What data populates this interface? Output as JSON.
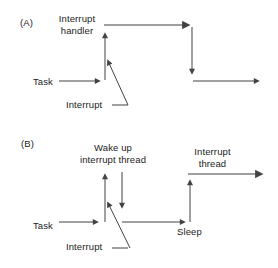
{
  "colors": {
    "line": "#434343",
    "line_light": "#7f7f7f",
    "text": "#232323",
    "background": "#ffffff"
  },
  "diagram_a": {
    "label": "(A)",
    "interrupt_handler_line1": "Interrupt",
    "interrupt_handler_line2": "handler",
    "task_label": "Task",
    "interrupt_label": "Interrupt"
  },
  "diagram_b": {
    "label": "(B)",
    "wake_up_line1": "Wake up",
    "wake_up_line2": "interrupt thread",
    "interrupt_thread_line1": "Interrupt",
    "interrupt_thread_line2": "thread",
    "task_label": "Task",
    "sleep_label": "Sleep",
    "interrupt_label": "Interrupt"
  }
}
